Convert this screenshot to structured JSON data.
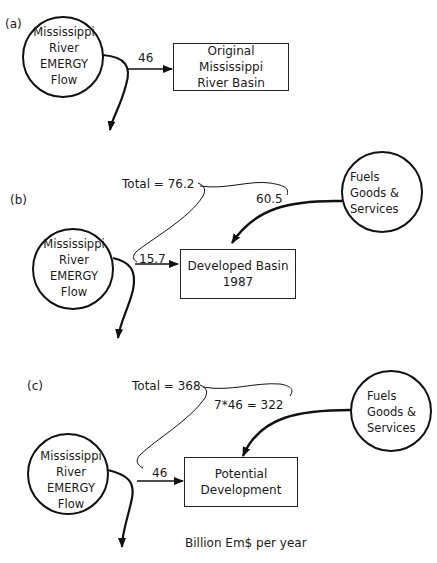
{
  "panels": [
    {
      "label": "(a)",
      "source": {
        "lines": [
          "Mississippi",
          "River",
          "EMERGY",
          "Flow"
        ]
      },
      "flow_value": "46",
      "target": {
        "lines": [
          "Original Mississippi",
          "River Basin"
        ]
      }
    },
    {
      "label": "(b)",
      "source": {
        "lines": [
          "Mississippi",
          "River",
          "EMERGY",
          "Flow"
        ]
      },
      "flow_value": "15.7",
      "total": "Total = 76.2",
      "purchased_value": "60.5",
      "purchased_source": {
        "lines": [
          "Fuels",
          "Goods &",
          "Services"
        ]
      },
      "target": {
        "lines": [
          "Developed Basin",
          "1987"
        ]
      }
    },
    {
      "label": "(c)",
      "source": {
        "lines": [
          "Mississippi",
          "River",
          "EMERGY",
          "Flow"
        ]
      },
      "flow_value": "46",
      "total": "Total = 368",
      "purchased_value": "7*46 = 322",
      "purchased_source": {
        "lines": [
          "Fuels",
          "Goods &",
          "Services"
        ]
      },
      "target": {
        "lines": [
          "Potential",
          "Development"
        ]
      }
    }
  ],
  "units": "Billion Em$ per year"
}
